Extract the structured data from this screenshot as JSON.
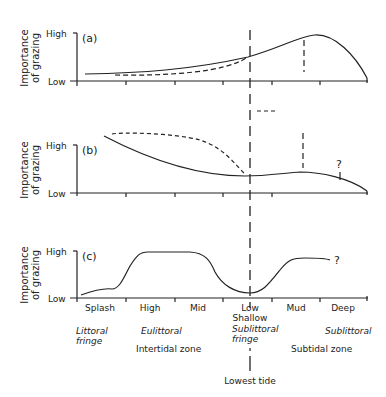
{
  "figure": {
    "y_axis_label_line1": "Importance",
    "y_axis_label_line2": "of grazing",
    "y_high": "High",
    "y_low": "Low",
    "panels": [
      {
        "id": "a",
        "label": "(a)"
      },
      {
        "id": "b",
        "label": "(b)",
        "question": "?"
      },
      {
        "id": "c",
        "label": "(c)",
        "question": "?"
      }
    ],
    "x_categories": [
      "Splash",
      "High",
      "Mid",
      "Low",
      "Mud",
      "Deep"
    ],
    "x_sub_low": "Shallow",
    "zones_italic": {
      "littoral_fringe_1": "Littoral",
      "littoral_fringe_2": "fringe",
      "eulittoral": "Eulittoral",
      "sublittoral_fringe_1": "Sublittoral",
      "sublittoral_fringe_2": "fringe",
      "sublittoral": "Sublittoral"
    },
    "zones": {
      "intertidal": "Intertidal zone",
      "subtidal": "Subtidal zone"
    },
    "lowest_tide": "Lowest tide"
  },
  "colors": {
    "ink": "#222222",
    "background": "#ffffff"
  }
}
